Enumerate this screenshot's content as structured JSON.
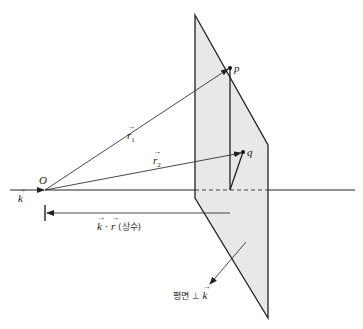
{
  "figure": {
    "origin_label": "O",
    "point_p_label": "p",
    "point_q_label": "q",
    "vector_k_label": "k",
    "vector_r1_label": "r",
    "vector_r1_sub": "1",
    "vector_r2_label": "r",
    "vector_r2_sub": "2",
    "dot_product_k": "k",
    "dot_product_dot": "·",
    "dot_product_r": "r",
    "dot_product_note": "(상수)",
    "plane_label_text": "평면 ⊥",
    "plane_label_k": "k"
  },
  "colors": {
    "plane_fill": "#e8e8e8",
    "line": "#222222"
  }
}
